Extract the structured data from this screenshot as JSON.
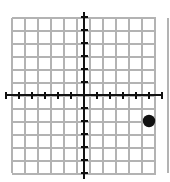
{
  "figure": {
    "kind": "coordinate-grid-plot",
    "width": 170,
    "height": 182,
    "background_color": "#ffffff"
  },
  "grid": {
    "columns": 12,
    "rows": 12,
    "cell_size_px": 13,
    "left_px": 12,
    "top_px": 18,
    "right_px": 156,
    "bottom_px": 173,
    "line_color": "#b3b3b3",
    "line_width_px": 1.4,
    "visible": true
  },
  "axes": {
    "color": "#111111",
    "line_width_px": 2.6,
    "origin_px": {
      "x": 84,
      "y": 95
    },
    "x_axis": {
      "label": "",
      "min": -6,
      "max": 6,
      "tick_step": 1,
      "tick_length_px": 7,
      "tick_width_px": 2.4,
      "overhang_px": 6,
      "tick_values": [
        -6,
        -5,
        -4,
        -3,
        -2,
        -1,
        1,
        2,
        3,
        4,
        5,
        6
      ],
      "tick_labels_visible": false
    },
    "y_axis": {
      "label": "",
      "min": -6,
      "max": 6,
      "tick_step": 1,
      "tick_length_px": 7,
      "tick_width_px": 2.4,
      "overhang_px": 6,
      "tick_values": [
        -6,
        -5,
        -4,
        -3,
        -2,
        -1,
        1,
        2,
        3,
        4,
        5,
        6
      ],
      "tick_labels_visible": false
    }
  },
  "points": [
    {
      "name": "plotted-point",
      "x": 5,
      "y": -2,
      "radius_px": 6.2,
      "fill_color": "#111111",
      "label": "",
      "label_visible": false
    }
  ],
  "chart_data": {
    "type": "scatter",
    "title": "",
    "xlabel": "",
    "ylabel": "",
    "xlim": [
      -6,
      6
    ],
    "ylim": [
      -6,
      6
    ],
    "grid": true,
    "legend": false,
    "series": [
      {
        "name": "point",
        "x": [
          5
        ],
        "y": [
          -2
        ]
      }
    ]
  }
}
